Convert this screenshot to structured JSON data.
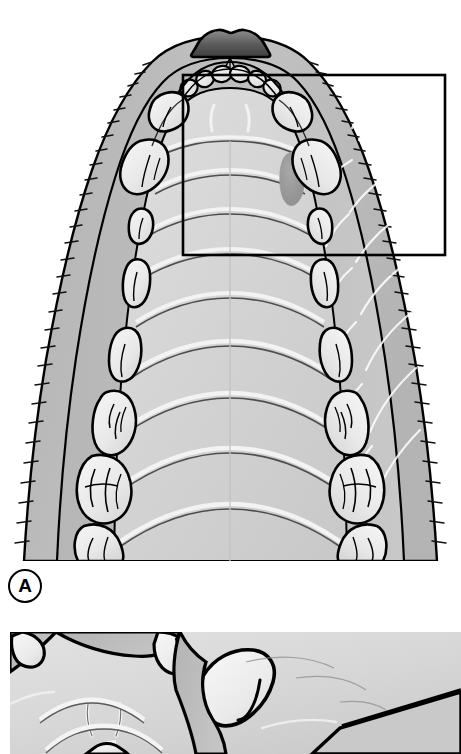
{
  "figure": {
    "domain_note": "anatomical line illustration, grayscale"
  },
  "panels": [
    {
      "id": "A",
      "label": "A",
      "label_shape": "circle",
      "caption": "",
      "inset_box": {
        "present": true,
        "x": 183,
        "y": 75,
        "width": 262,
        "height": 180,
        "stroke": "#000000",
        "stroke_width": 2.6,
        "purpose": "region-of-interest marker enlarged in panel B"
      },
      "structures": [
        {
          "name": "rhinarium",
          "count": 1,
          "note": "dark gray nose pad at rostral tip"
        },
        {
          "name": "incisor",
          "count": 6,
          "note": "small rounded incisors in rostral arc"
        },
        {
          "name": "canine",
          "count": 2,
          "note": "large paired rostro-lateral teeth"
        },
        {
          "name": "premolar",
          "count": 6,
          "note": "three per side, increasing in size caudally"
        },
        {
          "name": "molar",
          "count": 6,
          "note": "three per side, broad multi-cusped crowns"
        },
        {
          "name": "palatal-ruga",
          "count": 9,
          "note": "transverse ridges across hard palate"
        },
        {
          "name": "incisive-papilla",
          "count": 1
        },
        {
          "name": "palatine-gland-opening",
          "count": 1,
          "note": "dark oval on right palate margin"
        },
        {
          "name": "buccal-hair-fringe",
          "count": 2,
          "note": "hatched hair along lip margins"
        },
        {
          "name": "median-palatine-raphe",
          "count": 1
        }
      ]
    },
    {
      "id": "B",
      "label": "",
      "caption": "",
      "note": "enlarged detail of boxed region in panel A, cropped by page edge",
      "structures": [
        {
          "name": "canine",
          "count": 1,
          "note": "enlarged canine crown"
        },
        {
          "name": "incisor",
          "count": 2
        },
        {
          "name": "palatal-ruga",
          "count": 3
        },
        {
          "name": "median-palatine-raphe",
          "count": 1
        },
        {
          "name": "incisive-papilla",
          "count": 1
        }
      ]
    }
  ],
  "palette": {
    "background": "#ffffff",
    "outline": "#000000",
    "lip_outer": "#b9b9b9",
    "lip_mid": "#c6c6c6",
    "gingiva": "#bdbdbd",
    "palate_light": "#dcdcdc",
    "palate_mid": "#d2d2d2",
    "palate_shadow": "#c4c4c4",
    "tooth_light": "#f0f0f0",
    "tooth_mid": "#e2e2e2",
    "rhinarium_dark": "#4a4a4a",
    "rhinarium_light": "#8e8e8e",
    "gland_oval": "#9a9a9a",
    "ruga_highlight": "#f3f3f3"
  }
}
